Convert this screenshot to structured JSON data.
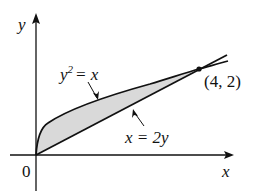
{
  "diagram": {
    "axes": {
      "x_label": "x",
      "y_label": "y",
      "origin_label": "0"
    },
    "curves": [
      {
        "name": "parabola",
        "equation_lhs": "y",
        "equation_exp": "2",
        "equation_rhs": "= x"
      },
      {
        "name": "line",
        "equation": "x = 2y"
      }
    ],
    "intersection_point": {
      "label": "(4, 2)",
      "x": 4,
      "y": 2
    },
    "shaded_region": {
      "between": [
        "y^2 = x",
        "x = 2y"
      ],
      "fill": "#d9d9d9"
    },
    "colors": {
      "stroke": "#111111",
      "fill": "#d9d9d9"
    }
  }
}
